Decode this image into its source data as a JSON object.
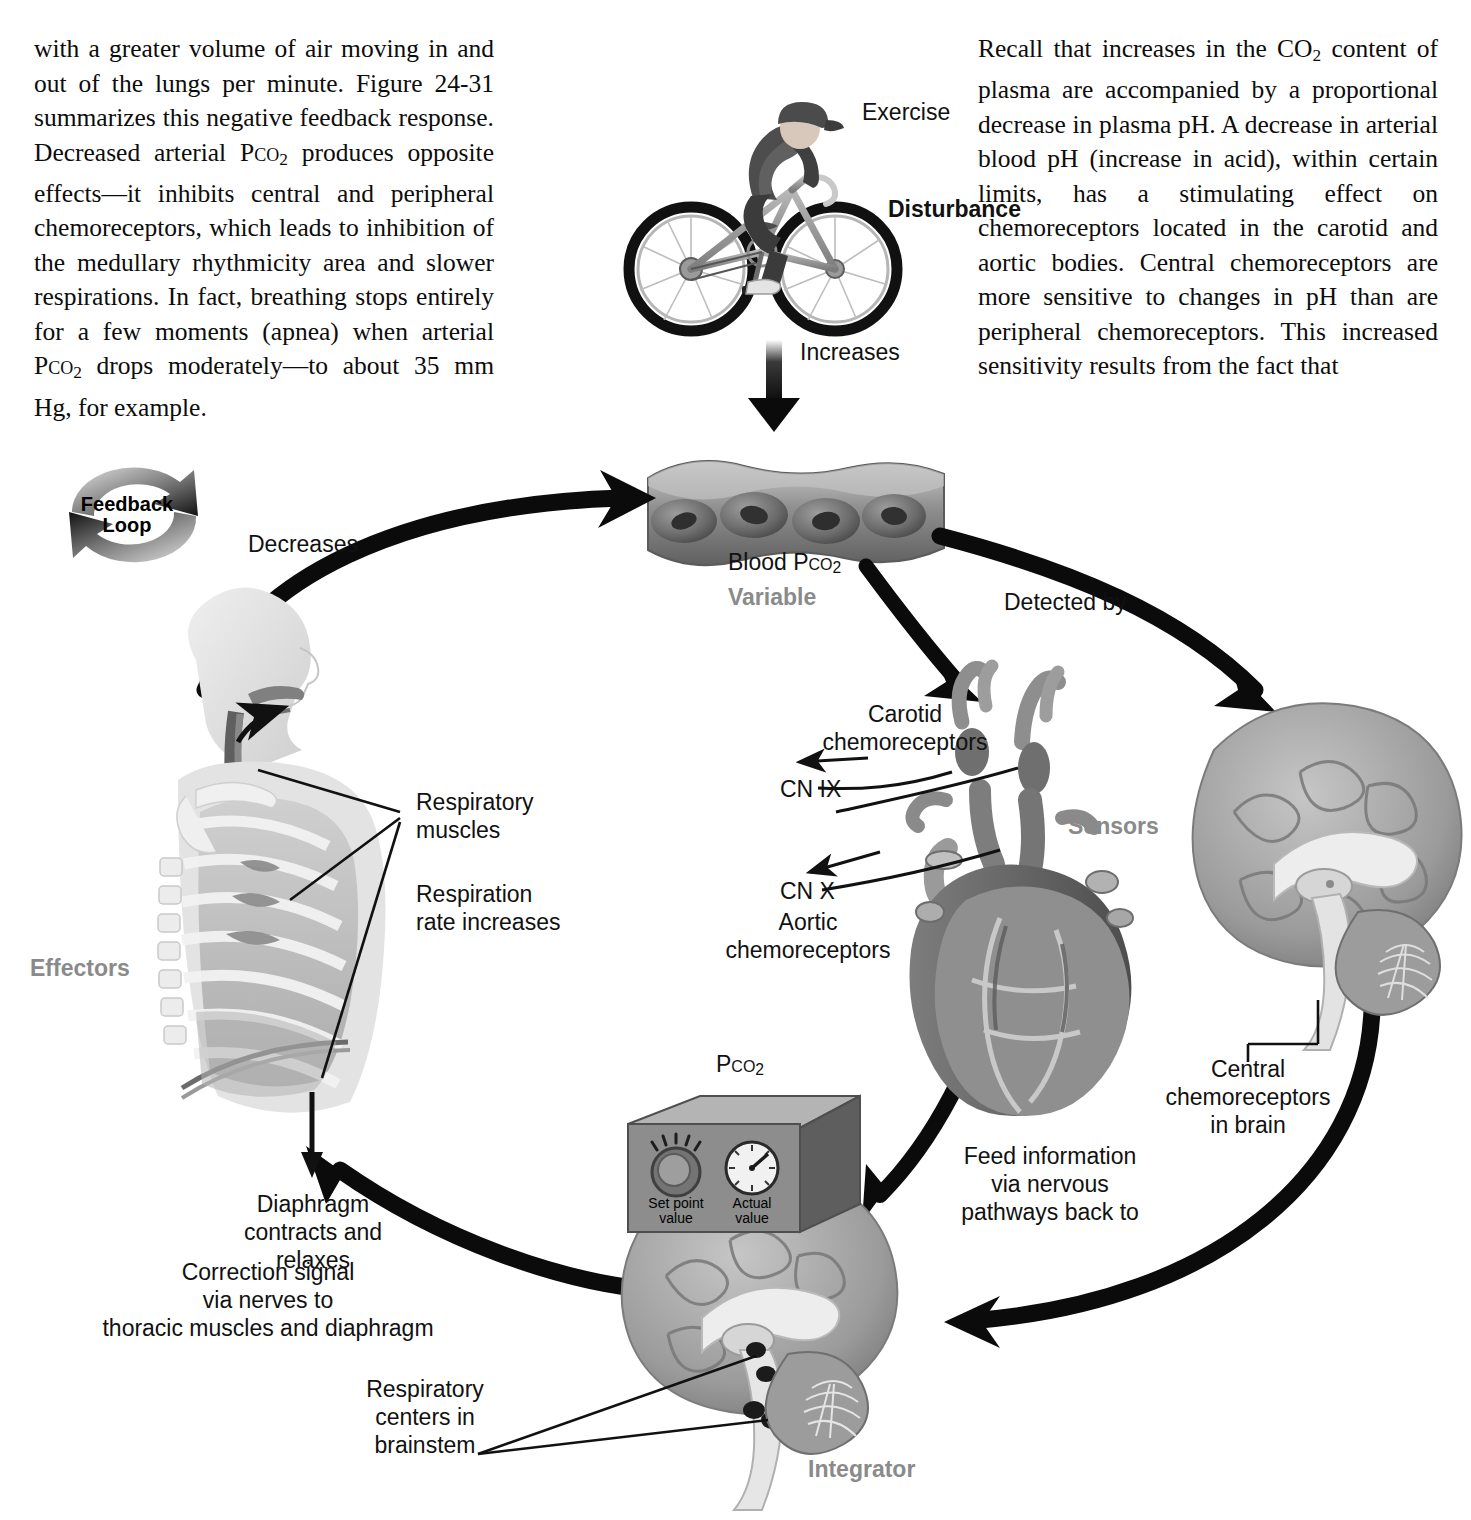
{
  "page": {
    "left_column": [
      "with a greater volume of air moving in and out of the lungs per minute. Figure 24-31 summarizes this negative feedback response. Decreased arterial Pco2 produces opposite effects—it inhibits central and peripheral chemoreceptors, which leads to inhibition of the medullary rhythmicity area and slower respirations. In fact, breathing stops entirely for a few moments (apnea) when arterial Pco2 drops moderately—to about 35 mm Hg, for example."
    ],
    "right_column": [
      "Recall that increases in the CO2 content of plasma are accompanied by a proportional decrease in plasma pH. A decrease in arterial blood pH (increase in acid), within certain limits, has a stimulating effect on chemoreceptors located in the carotid and aortic bodies. Central chemoreceptors are more sensitive to changes in pH than are peripheral chemoreceptors. This increased sensitivity results from the fact that"
    ]
  },
  "figure": {
    "name": "negative-feedback-control-of-respiration",
    "feedback_badge": "Feedback\nLoop",
    "labels": {
      "exercise": "Exercise",
      "disturbance": "Disturbance",
      "increases": "Increases",
      "decreases": "Decreases",
      "blood_pco2": "Blood Pco2",
      "variable": "Variable",
      "detected_by": "Detected by",
      "carotid_chemoreceptors": "Carotid\nchemoreceptors",
      "cn_ix": "CN IX",
      "cn_x": "CN X",
      "aortic_chemoreceptors": "Aortic\nchemoreceptors",
      "sensors": "Sensors",
      "central_chemoreceptors": "Central\nchemoreceptors\nin brain",
      "feed_information": "Feed information\nvia nervous\npathways back to",
      "integrator": "Integrator",
      "respiratory_centers": "Respiratory\ncenters in\nbrainstem",
      "correction_signal": "Correction signal\nvia nerves to\nthoracic muscles and diaphragm",
      "effectors": "Effectors",
      "respiratory_muscles": "Respiratory\nmuscles",
      "respiration_rate": "Respiration\nrate increases",
      "diaphragm": "Diaphragm\ncontracts and\nrelaxes"
    },
    "control_box": {
      "title": "Pco2",
      "set_point_label": "Set point\nvalue",
      "actual_label": "Actual\nvalue"
    },
    "colors": {
      "ink": "#111111",
      "gray_label": "#8a8a8a",
      "arrow": "#0b0b0b",
      "box_face": "#8d8d8d",
      "box_top": "#b4b4b4",
      "box_side": "#5e5e5e",
      "tissue_light": "#d8d8d8",
      "tissue_mid": "#a8a8a8",
      "tissue_dark": "#6f6f6f"
    }
  }
}
